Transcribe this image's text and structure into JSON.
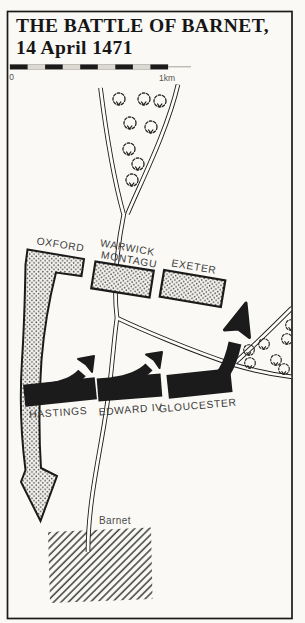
{
  "title": {
    "line1": "THE BATTLE OF BARNET,",
    "line2": "14 April 1471"
  },
  "scale_bar": {
    "zero_label": "0",
    "end_label": "1km"
  },
  "map": {
    "units": [
      {
        "label": "OXFORD",
        "style": "stippled"
      },
      {
        "label_lines": [
          "WARWICK",
          "MONTAGU"
        ],
        "style": "stippled"
      },
      {
        "label": "EXETER",
        "style": "stippled"
      },
      {
        "label": "HASTINGS",
        "style": "solid-black"
      },
      {
        "label": "EDWARD IV",
        "style": "solid-black"
      },
      {
        "label": "GLOUCESTER",
        "style": "solid-black"
      }
    ],
    "town": {
      "label": "Barnet"
    },
    "icons": {
      "tree": "dashed-bush-with-v-glyph"
    }
  },
  "colors": {
    "ink": "#1b1b1b",
    "paper": "#faf9f5",
    "road_fill": "#fdfcf9",
    "label_gray": "#3b3b3b",
    "scale_gray": "#57544f",
    "stipple_dot": "#4f4f4f",
    "hatch_line": "#4a4a4a"
  }
}
